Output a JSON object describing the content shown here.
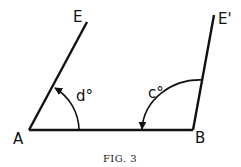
{
  "figure": {
    "caption": "Fig. 3",
    "caption_display": "FIG. 3",
    "points": {
      "A": "A",
      "B": "B",
      "E": "E",
      "E_prime": "E'"
    },
    "angles": {
      "at_A": "d°",
      "at_B": "c°"
    },
    "segments": [
      "AB",
      "AE",
      "BE'"
    ],
    "colors": {
      "ink": "#111111",
      "background": "#ffffff"
    }
  }
}
